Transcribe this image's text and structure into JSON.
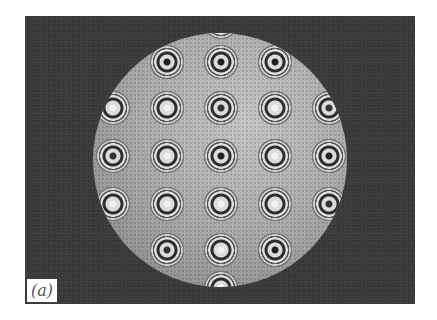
{
  "figure": {
    "panel_label": "(a)",
    "colors": {
      "background": "#3b3b3b",
      "disc": "#b0b0b0",
      "page": "#ffffff"
    },
    "rings": [
      {
        "x": 221,
        "y": 22,
        "center": "#ffffff"
      },
      {
        "x": 167,
        "y": 62,
        "center": "#222222"
      },
      {
        "x": 221,
        "y": 62,
        "center": "#222222"
      },
      {
        "x": 275,
        "y": 62,
        "center": "#222222"
      },
      {
        "x": 113,
        "y": 108,
        "center": "#f0f0f0"
      },
      {
        "x": 167,
        "y": 108,
        "center": "#f0f0f0"
      },
      {
        "x": 221,
        "y": 108,
        "center": "#333333"
      },
      {
        "x": 275,
        "y": 108,
        "center": "#f0f0f0"
      },
      {
        "x": 329,
        "y": 108,
        "center": "#333333"
      },
      {
        "x": 113,
        "y": 156,
        "center": "#333333"
      },
      {
        "x": 167,
        "y": 156,
        "center": "#f0f0f0"
      },
      {
        "x": 221,
        "y": 156,
        "center": "#222222"
      },
      {
        "x": 275,
        "y": 156,
        "center": "#f0f0f0"
      },
      {
        "x": 329,
        "y": 156,
        "center": "#222222"
      },
      {
        "x": 113,
        "y": 204,
        "center": "#f0f0f0"
      },
      {
        "x": 167,
        "y": 204,
        "center": "#f0f0f0"
      },
      {
        "x": 221,
        "y": 204,
        "center": "#f0f0f0"
      },
      {
        "x": 275,
        "y": 204,
        "center": "#f0f0f0"
      },
      {
        "x": 329,
        "y": 204,
        "center": "#333333"
      },
      {
        "x": 167,
        "y": 250,
        "center": "#333333"
      },
      {
        "x": 221,
        "y": 250,
        "center": "#f0f0f0"
      },
      {
        "x": 275,
        "y": 250,
        "center": "#222222"
      },
      {
        "x": 221,
        "y": 288,
        "center": "#ffffff"
      }
    ]
  }
}
